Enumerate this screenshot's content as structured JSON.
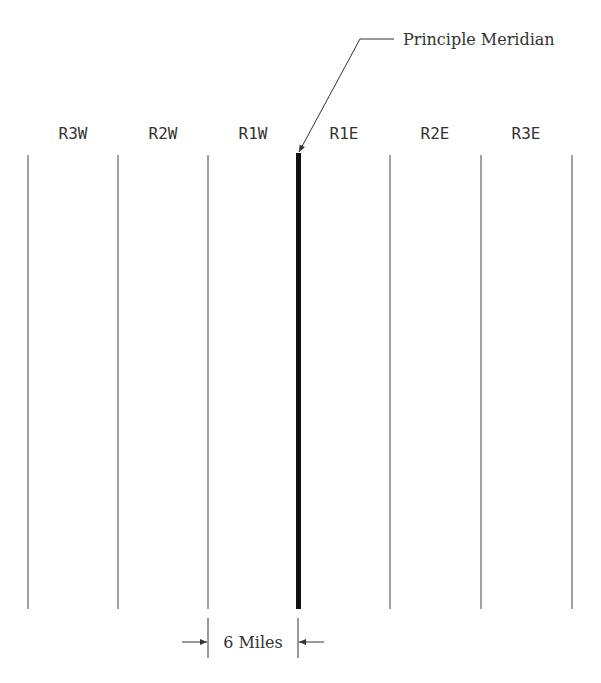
{
  "diagram": {
    "callout": {
      "label": "Principle Meridian"
    },
    "ranges": [
      {
        "label": "R3W",
        "x": 73
      },
      {
        "label": "R2W",
        "x": 163
      },
      {
        "label": "R1W",
        "x": 253
      },
      {
        "label": "R1E",
        "x": 344
      },
      {
        "label": "R2E",
        "x": 435
      },
      {
        "label": "R3E",
        "x": 526
      }
    ],
    "lines_x": [
      28,
      118,
      208,
      390,
      481,
      572
    ],
    "meridian_x": 298,
    "line_top": 155,
    "line_bottom": 609,
    "dimension": {
      "label": "6 Miles"
    }
  }
}
